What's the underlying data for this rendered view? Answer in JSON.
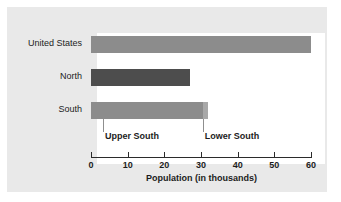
{
  "chart_data": {
    "type": "bar",
    "orientation": "horizontal",
    "title": "",
    "xlabel": "Population (in thousands)",
    "ylabel": "",
    "xlim": [
      0,
      60
    ],
    "xticks": [
      0,
      10,
      20,
      30,
      40,
      50,
      60
    ],
    "xtick_labels": [
      "0",
      "10",
      "20",
      "30",
      "40",
      "50",
      "60"
    ],
    "grid": false,
    "legend": "none",
    "categories": [
      "United States",
      "North",
      "South"
    ],
    "values": [
      60,
      27,
      32
    ],
    "bars": [
      {
        "category": "United States",
        "value": 60,
        "color": "#8c8c8c",
        "segments": [
          {
            "name": "United States",
            "start": 0,
            "end": 60,
            "color": "#8c8c8c"
          }
        ]
      },
      {
        "category": "North",
        "value": 27,
        "color": "#4d4d4d",
        "segments": [
          {
            "name": "North",
            "start": 0,
            "end": 27,
            "color": "#4d4d4d"
          }
        ]
      },
      {
        "category": "South",
        "value": 32,
        "color": "#8c8c8c",
        "segments": [
          {
            "name": "Upper South",
            "start": 0,
            "end": 30.5,
            "color": "#8c8c8c"
          },
          {
            "name": "Lower South",
            "start": 30.5,
            "end": 32,
            "color": "#a8a8a8"
          }
        ]
      }
    ],
    "annotations": [
      {
        "label": "Upper South",
        "x": 3.3
      },
      {
        "label": "Lower South",
        "x": 30.5
      }
    ],
    "colors": {
      "panel_background": "#e9e9e9",
      "plot_background": "#ffffff",
      "axis": "#2b2b2b",
      "text": "#1c1c1c",
      "bar_medium_gray": "#8c8c8c",
      "bar_dark_gray": "#4d4d4d",
      "bar_light_gray": "#a8a8a8",
      "leader_line": "#8f8f8f"
    }
  }
}
